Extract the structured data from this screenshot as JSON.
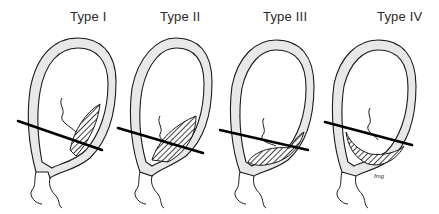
{
  "figure": {
    "panels": [
      {
        "id": "type-1",
        "label": "Type I",
        "cut_line": {
          "x1": 18,
          "y1": 121,
          "x2": 102,
          "y2": 150
        }
      },
      {
        "id": "type-2",
        "label": "Type II",
        "cut_line": {
          "x1": 118,
          "y1": 128,
          "x2": 203,
          "y2": 153
        }
      },
      {
        "id": "type-3",
        "label": "Type III",
        "cut_line": {
          "x1": 220,
          "y1": 130,
          "x2": 308,
          "y2": 150
        }
      },
      {
        "id": "type-4",
        "label": "Type IV",
        "cut_line": {
          "x1": 325,
          "y1": 122,
          "x2": 412,
          "y2": 145
        }
      }
    ],
    "artist_signature": "fmg"
  },
  "colors": {
    "ink": "#1a1a1a",
    "stipple_fill": "#e8e8e8",
    "background": "#ffffff"
  }
}
